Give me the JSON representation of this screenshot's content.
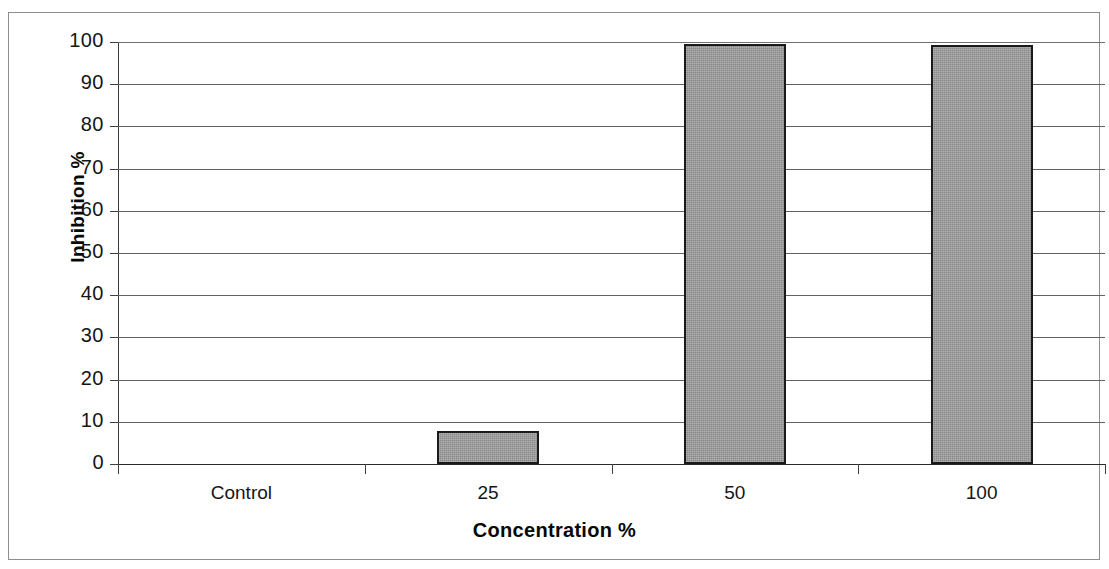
{
  "chart_data": {
    "type": "bar",
    "title": "",
    "categories": [
      "Control",
      "25",
      "50",
      "100"
    ],
    "values": [
      0,
      7.8,
      99.5,
      99.2
    ],
    "series": [
      {
        "name": "Inhibition",
        "values": [
          0,
          7.8,
          99.5,
          99.2
        ]
      }
    ],
    "xlabel": "Concentration %",
    "ylabel": "Inhibition %",
    "ylim": [
      0,
      100
    ],
    "yticks": [
      0,
      10,
      20,
      30,
      40,
      50,
      60,
      70,
      80,
      90,
      100
    ],
    "ytick_labels": [
      "0",
      "10",
      "20",
      "30",
      "40",
      "50",
      "60",
      "70",
      "80",
      "90",
      "100"
    ],
    "grid": "horizontal",
    "legend": "none",
    "bar_fill_color": "#9d9d9d",
    "bar_edge_color": "#1a1a1a",
    "background_color": "#ffffff",
    "axis_color": "#3a3a3a",
    "gridline_color": "#636363"
  }
}
